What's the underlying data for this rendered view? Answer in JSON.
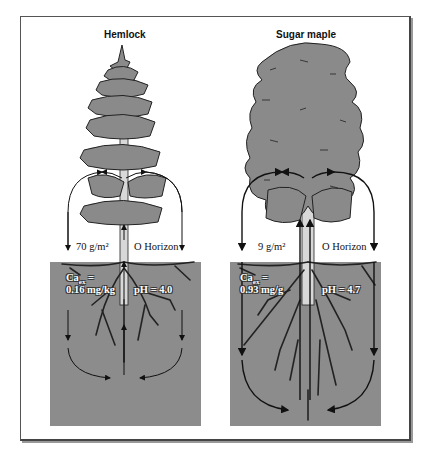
{
  "colors": {
    "soil": "#8c8c8c",
    "foliage": "#8a8a8a",
    "outline": "#222222",
    "trunk": "#d8d8d8",
    "frame": "#444444"
  },
  "panels": [
    {
      "title": "Hemlock",
      "litter_mass": "70 g/m²",
      "horizon_label": "O Horizon",
      "ca_label_line1": "Ca",
      "ca_subscript": "ex",
      "ca_label_eq": " =",
      "ca_value": "0.16 mg/kg",
      "ph_label": "pH = 4.0"
    },
    {
      "title": "Sugar maple",
      "litter_mass": "9 g/m²",
      "horizon_label": "O Horizon",
      "ca_label_line1": "Ca",
      "ca_subscript": "ex",
      "ca_label_eq": " =",
      "ca_value": "0.93 mg/g",
      "ph_label": "pH = 4.7"
    }
  ]
}
